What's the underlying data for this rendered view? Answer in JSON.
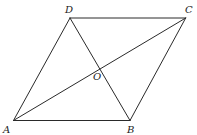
{
  "figure": {
    "type": "geometry-diagram",
    "shape": "rhombus",
    "stroke_color": "#2a2a2a",
    "points": {
      "A": {
        "label": "A",
        "x": 13.5,
        "y": 120.5,
        "label_x": 3,
        "label_y": 133
      },
      "B": {
        "label": "B",
        "x": 130,
        "y": 120.5,
        "label_x": 127,
        "label_y": 133
      },
      "C": {
        "label": "C",
        "x": 185.7,
        "y": 18,
        "label_x": 185,
        "label_y": 13
      },
      "D": {
        "label": "D",
        "x": 70,
        "y": 18,
        "label_x": 65,
        "label_y": 13
      },
      "O": {
        "label": "O",
        "x": 99.8,
        "y": 69.2,
        "label_x": 93,
        "label_y": 80
      }
    },
    "segments": [
      {
        "name": "AB",
        "from": "A",
        "to": "B"
      },
      {
        "name": "BC",
        "from": "B",
        "to": "C"
      },
      {
        "name": "CD",
        "from": "C",
        "to": "D"
      },
      {
        "name": "DA",
        "from": "D",
        "to": "A"
      },
      {
        "name": "AC",
        "from": "A",
        "to": "C"
      },
      {
        "name": "BD",
        "from": "B",
        "to": "D"
      }
    ]
  }
}
